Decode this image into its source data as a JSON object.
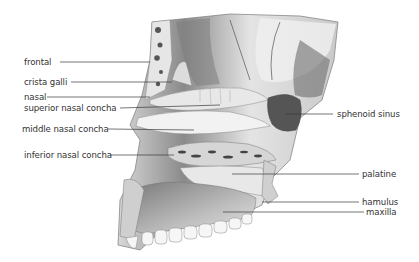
{
  "figure": {
    "labels_left": [
      {
        "id": "frontal",
        "text": "frontal",
        "x": 24,
        "y": 57,
        "line": [
          60,
          62,
          150,
          62
        ]
      },
      {
        "id": "crista-galli",
        "text": "crista galli",
        "x": 24,
        "y": 76,
        "line": [
          71,
          82,
          172,
          82
        ]
      },
      {
        "id": "nasal",
        "text": "nasal",
        "x": 24,
        "y": 92,
        "line": [
          47,
          97,
          150,
          97
        ]
      },
      {
        "id": "superior-nasal-concha",
        "text": "superior nasal concha",
        "x": 24,
        "y": 103,
        "line": [
          120,
          108,
          220,
          105
        ]
      },
      {
        "id": "middle-nasal-concha",
        "text": "middle nasal concha",
        "x": 22,
        "y": 124,
        "line": [
          108,
          129,
          194,
          130
        ]
      },
      {
        "id": "inferior-nasal-concha",
        "text": "inferior nasal concha",
        "x": 24,
        "y": 150,
        "line": [
          110,
          155,
          174,
          155
        ]
      }
    ],
    "labels_right": [
      {
        "id": "sphenoid-sinus",
        "text": "sphenoid sinus",
        "x": 337,
        "y": 109,
        "line": [
          285,
          114,
          333,
          114
        ]
      },
      {
        "id": "palatine",
        "text": "palatine",
        "x": 362,
        "y": 168,
        "line": [
          232,
          174,
          359,
          174
        ]
      },
      {
        "id": "hamulus",
        "text": "hamulus",
        "x": 362,
        "y": 196,
        "line": [
          262,
          202,
          359,
          202
        ]
      },
      {
        "id": "maxilla",
        "text": "maxilla",
        "x": 366,
        "y": 207,
        "line": [
          223,
          212,
          364,
          212
        ]
      }
    ],
    "colors": {
      "text": "#333333",
      "leader": "#3a3a3a",
      "bone_light": "#eeeeee",
      "bone_mid": "#bdbdbd",
      "bone_dark": "#6b6b6b",
      "cavity_dark": "#4a4a4a"
    }
  }
}
